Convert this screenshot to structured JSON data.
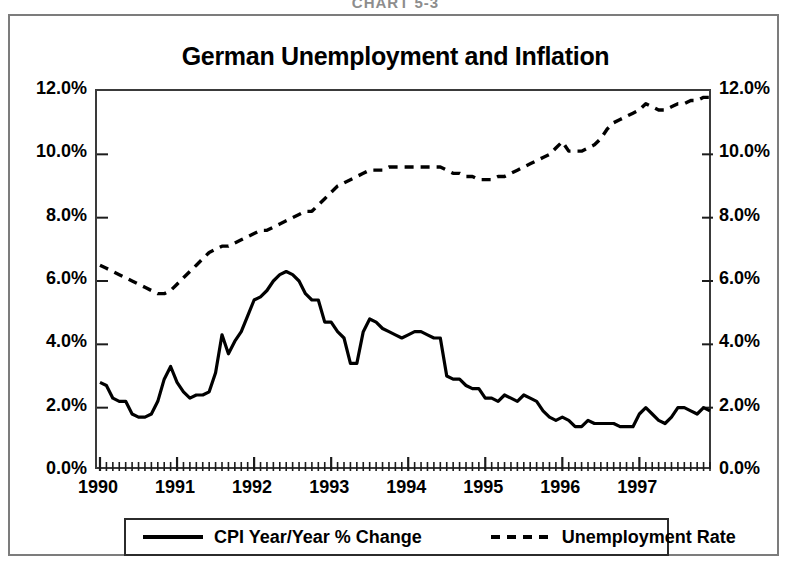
{
  "page_header": "CHART 5-3",
  "chart": {
    "title": "German Unemployment and Inflation"
  },
  "axes": {
    "y_left_ticks": [
      "0.0%",
      "2.0%",
      "4.0%",
      "6.0%",
      "8.0%",
      "10.0%",
      "12.0%"
    ],
    "y_right_ticks": [
      "0.0%",
      "2.0%",
      "4.0%",
      "6.0%",
      "8.0%",
      "10.0%",
      "12.0%"
    ],
    "x_ticks": [
      "1990",
      "1991",
      "1992",
      "1993",
      "1994",
      "1995",
      "1996",
      "1997"
    ]
  },
  "legend": {
    "items": [
      {
        "label": "CPI Year/Year % Change",
        "style": "solid",
        "color": "#000000"
      },
      {
        "label": "Unemployment Rate",
        "style": "dashed",
        "color": "#000000"
      }
    ]
  },
  "chart_data": {
    "type": "line",
    "title": "German Unemployment and Inflation",
    "xlabel": "",
    "ylabel": "",
    "ylim": [
      0,
      12
    ],
    "xlim": [
      "1990-01",
      "1997-12"
    ],
    "grid": false,
    "legend_position": "bottom",
    "y_axis_format": "percent",
    "y_ticks": [
      0,
      2,
      4,
      6,
      8,
      10,
      12
    ],
    "x_tick_labels": [
      "1990",
      "1991",
      "1992",
      "1993",
      "1994",
      "1995",
      "1996",
      "1997"
    ],
    "x": [
      "1990-01",
      "1990-02",
      "1990-03",
      "1990-04",
      "1990-05",
      "1990-06",
      "1990-07",
      "1990-08",
      "1990-09",
      "1990-10",
      "1990-11",
      "1990-12",
      "1991-01",
      "1991-02",
      "1991-03",
      "1991-04",
      "1991-05",
      "1991-06",
      "1991-07",
      "1991-08",
      "1991-09",
      "1991-10",
      "1991-11",
      "1991-12",
      "1992-01",
      "1992-02",
      "1992-03",
      "1992-04",
      "1992-05",
      "1992-06",
      "1992-07",
      "1992-08",
      "1992-09",
      "1992-10",
      "1992-11",
      "1992-12",
      "1993-01",
      "1993-02",
      "1993-03",
      "1993-04",
      "1993-05",
      "1993-06",
      "1993-07",
      "1993-08",
      "1993-09",
      "1993-10",
      "1993-11",
      "1993-12",
      "1994-01",
      "1994-02",
      "1994-03",
      "1994-04",
      "1994-05",
      "1994-06",
      "1994-07",
      "1994-08",
      "1994-09",
      "1994-10",
      "1994-11",
      "1994-12",
      "1995-01",
      "1995-02",
      "1995-03",
      "1995-04",
      "1995-05",
      "1995-06",
      "1995-07",
      "1995-08",
      "1995-09",
      "1995-10",
      "1995-11",
      "1995-12",
      "1996-01",
      "1996-02",
      "1996-03",
      "1996-04",
      "1996-05",
      "1996-06",
      "1996-07",
      "1996-08",
      "1996-09",
      "1996-10",
      "1996-11",
      "1996-12",
      "1997-01",
      "1997-02",
      "1997-03",
      "1997-04",
      "1997-05",
      "1997-06",
      "1997-07",
      "1997-08",
      "1997-09",
      "1997-10",
      "1997-11",
      "1997-12"
    ],
    "series": [
      {
        "name": "CPI Year/Year % Change",
        "style": "solid",
        "color": "#000000",
        "units": "percent",
        "values": [
          2.8,
          2.7,
          2.3,
          2.2,
          2.2,
          1.8,
          1.7,
          1.7,
          1.8,
          2.2,
          2.9,
          3.3,
          2.8,
          2.5,
          2.3,
          2.4,
          2.4,
          2.5,
          3.1,
          4.3,
          3.7,
          4.1,
          4.4,
          4.9,
          5.4,
          5.5,
          5.7,
          6.0,
          6.2,
          6.3,
          6.2,
          6.0,
          5.6,
          5.4,
          5.4,
          4.7,
          4.7,
          4.4,
          4.2,
          3.4,
          3.4,
          4.4,
          4.8,
          4.7,
          4.5,
          4.4,
          4.3,
          4.2,
          4.3,
          4.4,
          4.4,
          4.3,
          4.2,
          4.2,
          3.0,
          2.9,
          2.9,
          2.7,
          2.6,
          2.6,
          2.3,
          2.3,
          2.2,
          2.4,
          2.3,
          2.2,
          2.4,
          2.3,
          2.2,
          1.9,
          1.7,
          1.6,
          1.7,
          1.6,
          1.4,
          1.4,
          1.6,
          1.5,
          1.5,
          1.5,
          1.5,
          1.4,
          1.4,
          1.4,
          1.8,
          2.0,
          1.8,
          1.6,
          1.5,
          1.7,
          2.0,
          2.0,
          1.9,
          1.8,
          2.0,
          1.9
        ]
      },
      {
        "name": "Unemployment Rate",
        "style": "dashed",
        "color": "#000000",
        "units": "percent",
        "values": [
          6.5,
          6.4,
          6.3,
          6.2,
          6.1,
          6.0,
          5.9,
          5.8,
          5.7,
          5.6,
          5.6,
          5.7,
          5.9,
          6.1,
          6.3,
          6.5,
          6.7,
          6.9,
          7.0,
          7.1,
          7.1,
          7.2,
          7.3,
          7.4,
          7.5,
          7.6,
          7.6,
          7.7,
          7.8,
          7.9,
          8.0,
          8.1,
          8.2,
          8.2,
          8.4,
          8.6,
          8.8,
          9.0,
          9.1,
          9.2,
          9.3,
          9.4,
          9.5,
          9.5,
          9.5,
          9.6,
          9.6,
          9.6,
          9.6,
          9.6,
          9.6,
          9.6,
          9.6,
          9.6,
          9.5,
          9.4,
          9.4,
          9.3,
          9.3,
          9.2,
          9.2,
          9.2,
          9.3,
          9.3,
          9.4,
          9.5,
          9.6,
          9.7,
          9.8,
          9.9,
          10.0,
          10.2,
          10.4,
          10.1,
          10.1,
          10.1,
          10.2,
          10.3,
          10.5,
          10.8,
          11.0,
          11.1,
          11.2,
          11.3,
          11.4,
          11.6,
          11.5,
          11.4,
          11.4,
          11.5,
          11.6,
          11.6,
          11.7,
          11.7,
          11.8,
          11.8
        ]
      }
    ]
  }
}
